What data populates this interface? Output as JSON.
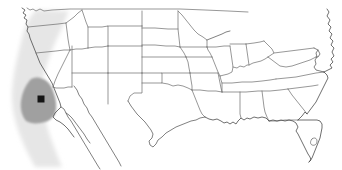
{
  "figure": {
    "name": "contiguous-united-states-locator-map",
    "width": 342,
    "height": 170,
    "background_color": "#ffffff",
    "description": "Outline map of the contiguous United States with state borders. A light gray shaded band runs along the Pacific coast; a darker gray region covers central and southern California; a black square marker is placed inside the dark gray region."
  },
  "style": {
    "state_border_color": "#6b6b6b",
    "state_border_width": 0.7,
    "coast_border_color": "#4a4a4a",
    "coast_border_width": 0.8,
    "land_fill": "#ffffff",
    "light_shade_color": "#e6e6e6",
    "dark_shade_color": "#a0a0a0",
    "marker_color": "#141414"
  },
  "layers": {
    "light_shade": {
      "name": "pacific-coastal-light-shading",
      "color": "#e6e6e6",
      "opacity": 1,
      "blur": 2.2
    },
    "dark_shade": {
      "name": "california-dark-shading",
      "color": "#a0a0a0",
      "opacity": 1,
      "blur": 0.8
    }
  },
  "marker": {
    "name": "study-site-marker",
    "shape": "square",
    "color": "#141414",
    "x": 41,
    "y": 99,
    "size": 7
  },
  "chart_data": {
    "type": "map",
    "title": "",
    "projection": "unlabeled-north-america-outline",
    "regions": [
      {
        "name": "pacific-coastal-band",
        "label": "",
        "fill": "#e6e6e6",
        "extent_px": {
          "x": [
            0,
            70
          ],
          "y": [
            8,
            168
          ]
        }
      },
      {
        "name": "california-highlight",
        "label": "",
        "fill": "#a0a0a0",
        "extent_px": {
          "x": [
            21,
            57
          ],
          "y": [
            79,
            124
          ]
        }
      }
    ],
    "points": [
      {
        "name": "study-site",
        "x": 41,
        "y": 99,
        "marker": "square",
        "color": "#141414",
        "size": 7
      }
    ],
    "legend": [],
    "annotations": []
  }
}
